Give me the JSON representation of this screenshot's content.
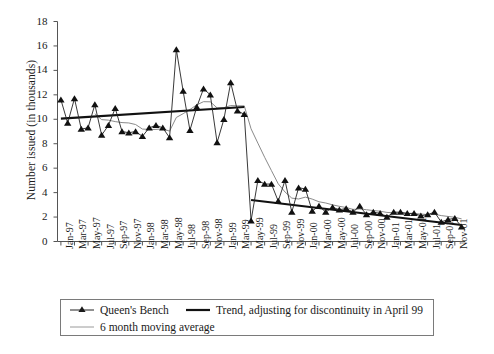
{
  "figure": {
    "background": "#ffffff",
    "ink_color": "#1a1a1a",
    "moving_avg_color": "#8a8a8a",
    "trend_color": "#111111",
    "series_color": "#222222"
  },
  "axes": {
    "y_title": "Number issued (in thousands)",
    "y_ticks": [
      0,
      2,
      4,
      6,
      8,
      10,
      12,
      14,
      16,
      18
    ],
    "y_min": 0,
    "y_max": 18,
    "x_title": "",
    "x_tick_labels": [
      "Jan-97",
      "Mar-97",
      "May-97",
      "Jul-97",
      "Sep-97",
      "Nov-97",
      "Jan-98",
      "Mar-98",
      "May-98",
      "Jul-98",
      "Sep-98",
      "Nov-98",
      "Jan-99",
      "Mar-99",
      "May-99",
      "Jul-99",
      "Sep-99",
      "Nov-99",
      "Jan-00",
      "Mar-00",
      "May-00",
      "Jul-00",
      "Sep-00",
      "Nov-00",
      "Jan-01",
      "Mar-01",
      "May-01",
      "Jul-01",
      "Sep-01",
      "Nov-01"
    ]
  },
  "legend": {
    "items": [
      {
        "label": "Queen's Bench",
        "marker": "line-with-triangle-marker",
        "color": "#222222"
      },
      {
        "label": "Trend, adjusting for discontinuity in April 99",
        "marker": "thick-line",
        "color": "#111111"
      },
      {
        "label": "6 month moving average",
        "marker": "thin-line",
        "color": "#8a8a8a"
      }
    ]
  },
  "caption_partial": "",
  "chart_data": {
    "type": "line",
    "title": "",
    "xlabel": "",
    "ylabel": "Number issued (in thousands)",
    "ylim": [
      0,
      18
    ],
    "ytick_step": 2,
    "grid": false,
    "legend_position": "below-axes",
    "x": [
      "Jan-97",
      "Feb-97",
      "Mar-97",
      "Apr-97",
      "May-97",
      "Jun-97",
      "Jul-97",
      "Aug-97",
      "Sep-97",
      "Oct-97",
      "Nov-97",
      "Dec-97",
      "Jan-98",
      "Feb-98",
      "Mar-98",
      "Apr-98",
      "May-98",
      "Jun-98",
      "Jul-98",
      "Aug-98",
      "Sep-98",
      "Oct-98",
      "Nov-98",
      "Dec-98",
      "Jan-99",
      "Feb-99",
      "Mar-99",
      "Apr-99",
      "May-99",
      "Jun-99",
      "Jul-99",
      "Aug-99",
      "Sep-99",
      "Oct-99",
      "Nov-99",
      "Dec-99",
      "Jan-00",
      "Feb-00",
      "Mar-00",
      "Apr-00",
      "May-00",
      "Jun-00",
      "Jul-00",
      "Aug-00",
      "Sep-00",
      "Oct-00",
      "Nov-00",
      "Dec-00",
      "Jan-01",
      "Feb-01",
      "Mar-01",
      "Apr-01",
      "May-01",
      "Jun-01",
      "Jul-01",
      "Aug-01",
      "Sep-01",
      "Oct-01",
      "Nov-01",
      "Dec-01"
    ],
    "series": [
      {
        "name": "Queen's Bench",
        "type": "line-marker",
        "marker": "triangle",
        "color": "#222222",
        "values": [
          11.6,
          9.7,
          11.7,
          9.2,
          9.3,
          11.2,
          8.7,
          9.5,
          10.9,
          9.0,
          8.9,
          9.0,
          8.6,
          9.3,
          9.5,
          9.3,
          8.5,
          15.7,
          12.3,
          9.1,
          11.0,
          12.5,
          12.0,
          8.1,
          10.0,
          13.0,
          10.7,
          10.4,
          1.7,
          5.0,
          4.7,
          4.7,
          3.3,
          5.0,
          2.4,
          4.4,
          4.3,
          2.5,
          2.9,
          2.4,
          2.8,
          2.6,
          2.7,
          2.4,
          2.9,
          2.2,
          2.4,
          2.3,
          2.0,
          2.4,
          2.4,
          2.3,
          2.3,
          2.1,
          2.2,
          2.4,
          1.6,
          1.8,
          1.9,
          1.2
        ]
      },
      {
        "name": "6 month moving average",
        "type": "line",
        "color": "#8a8a8a",
        "values": [
          null,
          null,
          null,
          null,
          null,
          10.45,
          9.97,
          9.93,
          9.81,
          9.73,
          9.7,
          9.57,
          9.2,
          9.17,
          9.17,
          9.22,
          9.03,
          10.15,
          10.46,
          10.8,
          11.18,
          11.44,
          11.43,
          10.93,
          10.95,
          11.12,
          11.1,
          11.1,
          9.22,
          8.05,
          6.89,
          5.8,
          4.72,
          4.05,
          3.55,
          3.48,
          3.63,
          3.47,
          3.25,
          3.15,
          3.0,
          2.88,
          2.78,
          2.63,
          2.66,
          2.6,
          2.53,
          2.48,
          2.38,
          2.35,
          2.3,
          2.28,
          2.28,
          2.25,
          2.2,
          2.23,
          2.12,
          2.05,
          1.98,
          1.85
        ]
      }
    ],
    "trend_segments": [
      {
        "name": "Trend pre-April 99",
        "color": "#111111",
        "x_start": "Jan-97",
        "x_end": "Apr-99",
        "y_start": 10.05,
        "y_end": 11.0
      },
      {
        "name": "Trend post-April 99",
        "color": "#111111",
        "x_start": "May-99",
        "x_end": "Dec-01",
        "y_start": 3.4,
        "y_end": 1.35
      }
    ],
    "annotations": [
      {
        "text": "discontinuity in April 99",
        "x": "Apr-99"
      }
    ]
  }
}
